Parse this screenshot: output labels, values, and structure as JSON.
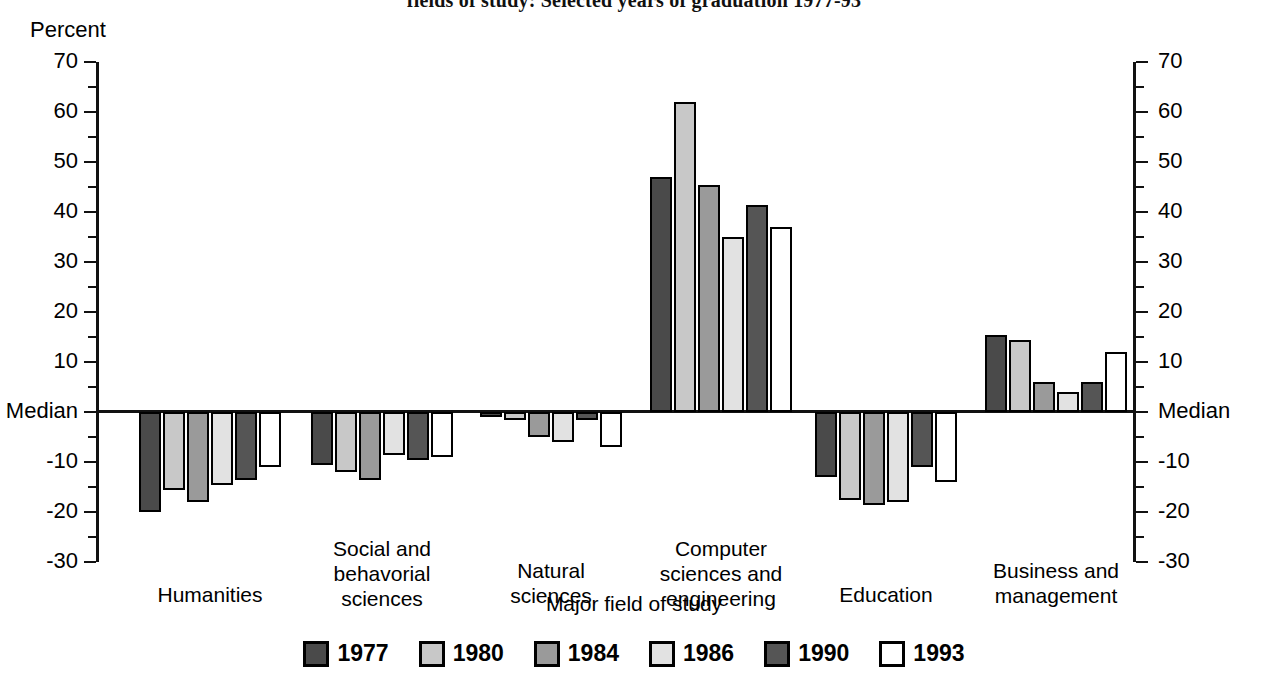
{
  "title": "fields of study:  Selected years of graduation 1977-93",
  "axis": {
    "y_axis_header": "Percent",
    "x_axis_title": "Major field of study",
    "y_ticks": [
      "70",
      "60",
      "50",
      "40",
      "30",
      "20",
      "10",
      "Median",
      "-10",
      "-20",
      "-30"
    ],
    "y_tick_values": [
      70,
      60,
      50,
      40,
      30,
      20,
      10,
      0,
      -10,
      -20,
      -30
    ],
    "y_min": -30,
    "y_max": 70
  },
  "legend": {
    "items": [
      {
        "label": "1977",
        "color": "#4a4a4a"
      },
      {
        "label": "1980",
        "color": "#c8c8c8"
      },
      {
        "label": "1984",
        "color": "#9a9a9a"
      },
      {
        "label": "1986",
        "color": "#e2e2e2"
      },
      {
        "label": "1990",
        "color": "#555555"
      },
      {
        "label": "1993",
        "color": "#ffffff"
      }
    ]
  },
  "chart_data": {
    "type": "bar",
    "title": "fields of study:  Selected years of graduation 1977-93",
    "xlabel": "Major field of study",
    "ylabel": "Percent",
    "ylim": [
      -30,
      70
    ],
    "grid": false,
    "legend_position": "bottom",
    "baseline_label": "Median",
    "categories": [
      "Humanities",
      "Social and behavioral sciences",
      "Natural sciences",
      "Computer sciences and engineering",
      "Education",
      "Business and management"
    ],
    "category_label_lines": [
      [
        "Humanities"
      ],
      [
        "Social and",
        "behavorial",
        "sciences"
      ],
      [
        "Natural",
        "sciences"
      ],
      [
        "Computer",
        "sciences and",
        "engineering"
      ],
      [
        "Education"
      ],
      [
        "Business and",
        "management"
      ]
    ],
    "series": [
      {
        "name": "1977",
        "color": "#4a4a4a",
        "values": [
          -20.0,
          -10.5,
          -1.0,
          47.0,
          -13.0,
          15.5
        ]
      },
      {
        "name": "1980",
        "color": "#c8c8c8",
        "values": [
          -15.5,
          -12.0,
          -1.5,
          62.0,
          -17.5,
          14.5
        ]
      },
      {
        "name": "1984",
        "color": "#9a9a9a",
        "values": [
          -18.0,
          -13.5,
          -5.0,
          45.5,
          -18.5,
          6.0
        ]
      },
      {
        "name": "1986",
        "color": "#e2e2e2",
        "values": [
          -14.5,
          -8.5,
          -6.0,
          35.0,
          -18.0,
          4.0
        ]
      },
      {
        "name": "1990",
        "color": "#555555",
        "values": [
          -13.5,
          -9.5,
          -1.5,
          41.5,
          -11.0,
          6.0
        ]
      },
      {
        "name": "1993",
        "color": "#ffffff",
        "values": [
          -11.0,
          -9.0,
          -7.0,
          37.0,
          -14.0,
          12.0
        ]
      }
    ]
  }
}
